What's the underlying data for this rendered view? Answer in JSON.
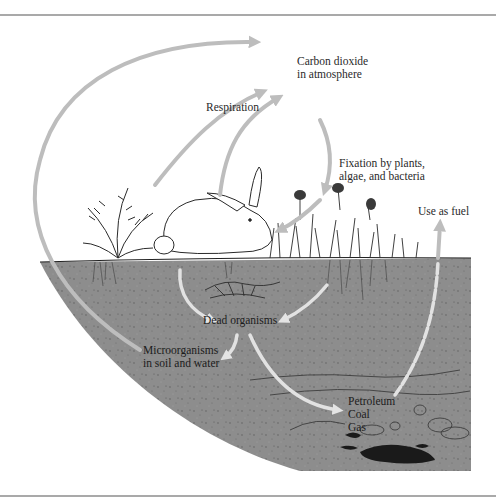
{
  "diagram": {
    "type": "carbon-cycle",
    "colors": {
      "arrow": "#bdbdbd",
      "arrow_on_soil": "#e2e2e2",
      "soil": "#8d8d8d",
      "frame": "#a9a9a9",
      "text": "#2a2a2a",
      "fossil_fuel": "#1a1a1a"
    },
    "labels": {
      "carbon_dioxide": {
        "line1": "Carbon dioxide",
        "line2": "in atmosphere"
      },
      "respiration": "Respiration",
      "fixation": {
        "line1": "Fixation by plants,",
        "line2": "algae, and bacteria"
      },
      "use_as_fuel": "Use as fuel",
      "dead_organisms": "Dead organisms",
      "microorganisms": {
        "line1": "Microorganisms",
        "line2": "in soil and water"
      },
      "fossil_fuels": {
        "line1": "Petroleum",
        "line2": "Coal",
        "line3": "Gas"
      }
    },
    "nodes": [
      "Carbon dioxide in atmosphere",
      "Plants/animals (fern, rabbit, grasses)",
      "Dead organisms",
      "Microorganisms in soil and water",
      "Petroleum, Coal, Gas"
    ],
    "edges": [
      {
        "from": "Microorganisms in soil and water",
        "to": "Carbon dioxide in atmosphere",
        "label": ""
      },
      {
        "from": "Fern",
        "to": "Carbon dioxide in atmosphere",
        "label": "Respiration"
      },
      {
        "from": "Rabbit",
        "to": "Carbon dioxide in atmosphere",
        "label": "Respiration"
      },
      {
        "from": "Carbon dioxide in atmosphere",
        "to": "Plants",
        "label": "Fixation by plants, algae, and bacteria"
      },
      {
        "from": "Fern",
        "to": "Dead organisms",
        "label": ""
      },
      {
        "from": "Plants",
        "to": "Dead organisms",
        "label": ""
      },
      {
        "from": "Dead organisms",
        "to": "Microorganisms in soil and water",
        "label": ""
      },
      {
        "from": "Dead organisms",
        "to": "Petroleum, Coal, Gas",
        "label": ""
      },
      {
        "from": "Petroleum, Coal, Gas",
        "to": "Carbon dioxide in atmosphere",
        "label": "Use as fuel"
      }
    ]
  }
}
